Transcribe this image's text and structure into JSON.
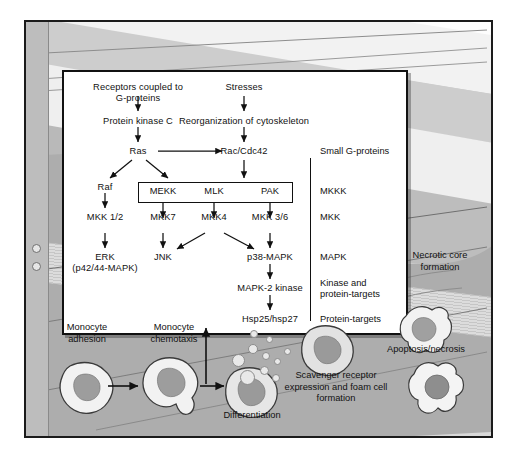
{
  "panel": {
    "nodes": {
      "receptors": "Receptors coupled to\nG-proteins",
      "receptors_line1": "Receptors coupled to",
      "receptors_line2": "G-proteins",
      "stresses": "Stresses",
      "pkc": "Protein kinase C",
      "reorg": "Reorganization of cytoskeleton",
      "ras": "Ras",
      "rac": "Rac/Cdc42",
      "raf": "Raf",
      "mekk": "MEKK",
      "mlk": "MLK",
      "pak": "PAK",
      "mkk12": "MKK 1/2",
      "mkk7": "MKK7",
      "mkk4": "MKK4",
      "mkk36": "MKK 3/6",
      "erk_line1": "ERK",
      "erk_line2": "(p42/44-MAPK)",
      "jnk": "JNK",
      "p38": "p38-MAPK",
      "mapk2k": "MAPK-2 kinase",
      "hsp": "Hsp25/hsp27"
    },
    "right_column": [
      {
        "id": "small-g-proteins",
        "label": "Small G-proteins"
      },
      {
        "id": "mkkk",
        "label": "MKKK"
      },
      {
        "id": "mkk",
        "label": "MKK"
      },
      {
        "id": "mapk",
        "label": "MAPK"
      },
      {
        "id": "kinase-targets-line1",
        "label": "Kinase and"
      },
      {
        "id": "kinase-targets-line2",
        "label": "protein-targets"
      },
      {
        "id": "protein-targets",
        "label": "Protein-targets"
      }
    ]
  },
  "tissue": {
    "labels": {
      "monocyte_adhesion_l1": "Monocyte",
      "monocyte_adhesion_l2": "adhesion",
      "monocyte_chemotaxis_l1": "Monocyte",
      "monocyte_chemotaxis_l2": "chemotaxis",
      "differentiation": "Differentiation",
      "scavenger_l1": "Scavenger receptor",
      "scavenger_l2": "expression and foam cell",
      "scavenger_l3": "formation",
      "necrotic_l1": "Necrotic core",
      "necrotic_l2": "formation",
      "apoptosis": "Apoptosis/necrosis"
    }
  },
  "colors": {
    "ink": "#111111",
    "panel_bg": "#ffffff",
    "plaque": "#b9b9b9",
    "lumen": "#fdfdfd",
    "cell_fill": "#f0f0f0",
    "nucleus": "#9a9a9a"
  }
}
